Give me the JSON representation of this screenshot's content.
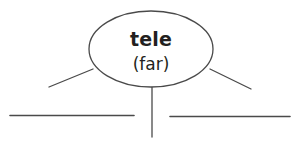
{
  "diagram": {
    "type": "root-word-web",
    "background_color": "#ffffff",
    "stroke_color": "#4a4a4a",
    "text_color": "#231f20",
    "oval": {
      "name": "root-word-oval",
      "root_word": "tele",
      "meaning": "(far)",
      "center_x": 151,
      "center_y": 49,
      "radius_x": 62,
      "radius_y": 38,
      "fill": "#ffffff",
      "stroke_width": 1.3
    },
    "branches": [
      {
        "name": "branch-left",
        "x1": 93,
        "y1": 69,
        "x2": 49,
        "y2": 87,
        "stroke_width": 1.3
      },
      {
        "name": "branch-center",
        "x1": 152,
        "y1": 87,
        "x2": 152,
        "y2": 137,
        "stroke_width": 1.3
      },
      {
        "name": "branch-right",
        "x1": 210,
        "y1": 69,
        "x2": 251,
        "y2": 89,
        "stroke_width": 1.3
      }
    ],
    "answer_lines": [
      {
        "name": "answer-line-left",
        "x1": 10,
        "y1": 115.5,
        "x2": 134,
        "y2": 115.5,
        "value": "",
        "stroke_width": 1.6
      },
      {
        "name": "answer-line-right",
        "x1": 170,
        "y1": 116.5,
        "x2": 290,
        "y2": 116.5,
        "value": "",
        "stroke_width": 1.6
      }
    ]
  }
}
